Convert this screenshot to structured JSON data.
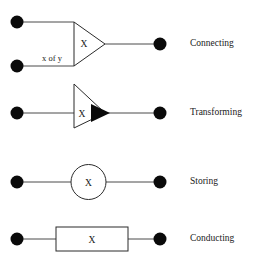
{
  "diagram": {
    "background_color": "#ffffff",
    "line_color": "#4a4a4a",
    "outline_color": "#2b2b2b",
    "terminal_color": "#0a0a0a",
    "text_color": "#1a1a1a",
    "rows": [
      {
        "name": "connecting",
        "label": "Connecting",
        "shape": "triangle",
        "shape_label": "X",
        "edge_note": "x of y",
        "inputs": 2,
        "outputs": 1,
        "filled_arrow": false
      },
      {
        "name": "transforming",
        "label": "Transforming",
        "shape": "triangle",
        "shape_label": "X",
        "edge_note": "",
        "inputs": 1,
        "outputs": 1,
        "filled_arrow": true
      },
      {
        "name": "storing",
        "label": "Storing",
        "shape": "circle",
        "shape_label": "X",
        "edge_note": "",
        "inputs": 1,
        "outputs": 1,
        "filled_arrow": false
      },
      {
        "name": "conducting",
        "label": "Conducting",
        "shape": "rectangle",
        "shape_label": "X",
        "edge_note": "",
        "inputs": 1,
        "outputs": 1,
        "filled_arrow": false
      }
    ]
  }
}
